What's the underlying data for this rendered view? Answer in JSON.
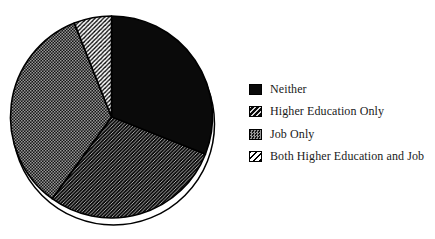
{
  "chart_data": {
    "type": "pie",
    "title": "",
    "legend_position": "right",
    "direction": "clockwise",
    "start_angle_deg": 0,
    "slices": [
      {
        "label": "Neither",
        "value": 31,
        "pattern": "solid-black"
      },
      {
        "label": "Higher Education Only",
        "value": 29,
        "pattern": "diag-white-on-black"
      },
      {
        "label": "Job Only",
        "value": 34,
        "pattern": "dot-gray"
      },
      {
        "label": "Both Higher Education and Job",
        "value": 6,
        "pattern": "diag-black-on-white"
      }
    ],
    "colors": {
      "ink": "#000000",
      "paper": "#ffffff",
      "hatch_light_line": "#d8d8d8",
      "dither_gray": "#979797"
    },
    "shadow_outline": {
      "offset_x": 2,
      "offset_y": 7
    }
  }
}
